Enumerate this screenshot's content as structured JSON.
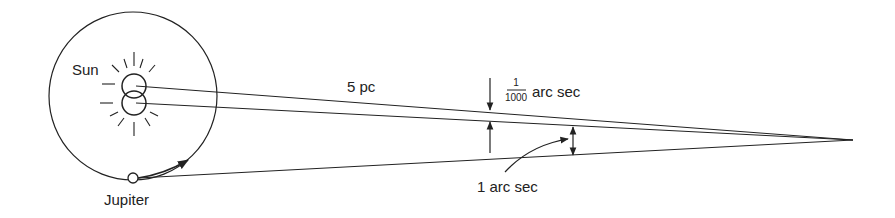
{
  "diagram": {
    "labels": {
      "sun": "Sun",
      "jupiter": "Jupiter",
      "distance": "5 pc",
      "frac_num": "1",
      "frac_den": "1000",
      "small_angle_unit": "arc sec",
      "large_angle": "1 arc sec"
    },
    "colors": {
      "stroke": "#222222",
      "background": "#ffffff"
    }
  }
}
